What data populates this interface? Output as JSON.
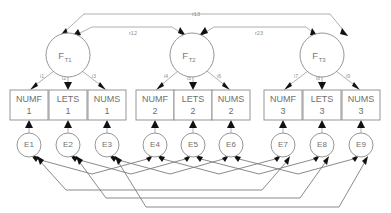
{
  "diagram": {
    "type": "structural-equation-model-path-diagram",
    "title": "",
    "canvas": {
      "width": 391,
      "height": 213
    },
    "factors": [
      {
        "id": "FT1",
        "label": "F",
        "subscript": "T1",
        "cx": 68,
        "cy": 55,
        "r": 22
      },
      {
        "id": "FT2",
        "label": "F",
        "subscript": "T2",
        "cx": 192,
        "cy": 55,
        "r": 22
      },
      {
        "id": "FT3",
        "label": "F",
        "subscript": "T3",
        "cx": 322,
        "cy": 55,
        "r": 22
      }
    ],
    "indicators": [
      {
        "id": "NUMF1",
        "name": "NUMF",
        "wave": "1",
        "cx": 29,
        "cy": 105,
        "w": 38,
        "h": 30
      },
      {
        "id": "LETS1",
        "name": "LETS",
        "wave": "1",
        "cx": 68,
        "cy": 105,
        "w": 38,
        "h": 30
      },
      {
        "id": "NUMS1",
        "name": "NUMS",
        "wave": "1",
        "cx": 107,
        "cy": 105,
        "w": 38,
        "h": 30
      },
      {
        "id": "NUMF2",
        "name": "NUMF",
        "wave": "2",
        "cx": 155,
        "cy": 105,
        "w": 38,
        "h": 30
      },
      {
        "id": "LETS2",
        "name": "LETS",
        "wave": "2",
        "cx": 193,
        "cy": 105,
        "w": 38,
        "h": 30
      },
      {
        "id": "NUMS2",
        "name": "NUMS",
        "wave": "2",
        "cx": 231,
        "cy": 105,
        "w": 38,
        "h": 30
      },
      {
        "id": "NUMF3",
        "name": "NUMF",
        "wave": "3",
        "cx": 283,
        "cy": 105,
        "w": 38,
        "h": 30
      },
      {
        "id": "LETS3",
        "name": "LETS",
        "wave": "3",
        "cx": 322,
        "cy": 105,
        "w": 38,
        "h": 30
      },
      {
        "id": "NUMS3",
        "name": "NUMS",
        "wave": "3",
        "cx": 361,
        "cy": 105,
        "w": 38,
        "h": 30
      }
    ],
    "errors": [
      {
        "id": "E1",
        "label": "E1",
        "cx": 29,
        "cy": 145,
        "r": 12
      },
      {
        "id": "E2",
        "label": "E2",
        "cx": 68,
        "cy": 145,
        "r": 12
      },
      {
        "id": "E3",
        "label": "E3",
        "cx": 107,
        "cy": 145,
        "r": 12
      },
      {
        "id": "E4",
        "label": "E4",
        "cx": 155,
        "cy": 145,
        "r": 12
      },
      {
        "id": "E5",
        "label": "E5",
        "cx": 193,
        "cy": 145,
        "r": 12
      },
      {
        "id": "E6",
        "label": "E6",
        "cx": 231,
        "cy": 145,
        "r": 12
      },
      {
        "id": "E7",
        "label": "E7",
        "cx": 283,
        "cy": 145,
        "r": 12
      },
      {
        "id": "E8",
        "label": "E8",
        "cx": 322,
        "cy": 145,
        "r": 12
      },
      {
        "id": "E9",
        "label": "E9",
        "cx": 361,
        "cy": 145,
        "r": 12
      }
    ],
    "loadings": [
      {
        "id": "i1",
        "label": "i1",
        "from": "FT1",
        "to": "NUMF1",
        "lx": 42,
        "ly": 78
      },
      {
        "id": "i2",
        "label": "i2",
        "from": "FT1",
        "to": "LETS1",
        "lx": 64,
        "ly": 80
      },
      {
        "id": "i3",
        "label": "i3",
        "from": "FT1",
        "to": "NUMS1",
        "lx": 94,
        "ly": 78
      },
      {
        "id": "i4",
        "label": "i4",
        "from": "FT2",
        "to": "NUMF2",
        "lx": 166,
        "ly": 78
      },
      {
        "id": "i5",
        "label": "i5",
        "from": "FT2",
        "to": "LETS2",
        "lx": 189,
        "ly": 80
      },
      {
        "id": "i6",
        "label": "i6",
        "from": "FT2",
        "to": "NUMS2",
        "lx": 219,
        "ly": 78
      },
      {
        "id": "i7",
        "label": "i7",
        "from": "FT3",
        "to": "NUMF3",
        "lx": 296,
        "ly": 78
      },
      {
        "id": "i8",
        "label": "i8",
        "from": "FT3",
        "to": "LETS3",
        "lx": 318,
        "ly": 80
      },
      {
        "id": "i9",
        "label": "i9",
        "from": "FT3",
        "to": "NUMS3",
        "lx": 348,
        "ly": 78
      }
    ],
    "factor_correlations": [
      {
        "id": "r12",
        "label": "r12",
        "from": "FT1",
        "to": "FT2",
        "lx": 133,
        "ly": 35
      },
      {
        "id": "r13",
        "label": "r13",
        "from": "FT1",
        "to": "FT3",
        "lx": 196,
        "ly": 16
      },
      {
        "id": "r23",
        "label": "r23",
        "from": "FT2",
        "to": "FT3",
        "lx": 259,
        "ly": 35
      }
    ],
    "error_correlations": [
      {
        "from": "E1",
        "to": "E4"
      },
      {
        "from": "E2",
        "to": "E5"
      },
      {
        "from": "E3",
        "to": "E6"
      },
      {
        "from": "E4",
        "to": "E7"
      },
      {
        "from": "E5",
        "to": "E8"
      },
      {
        "from": "E6",
        "to": "E9"
      },
      {
        "from": "E1",
        "to": "E7"
      },
      {
        "from": "E2",
        "to": "E8"
      },
      {
        "from": "E3",
        "to": "E9"
      }
    ]
  }
}
